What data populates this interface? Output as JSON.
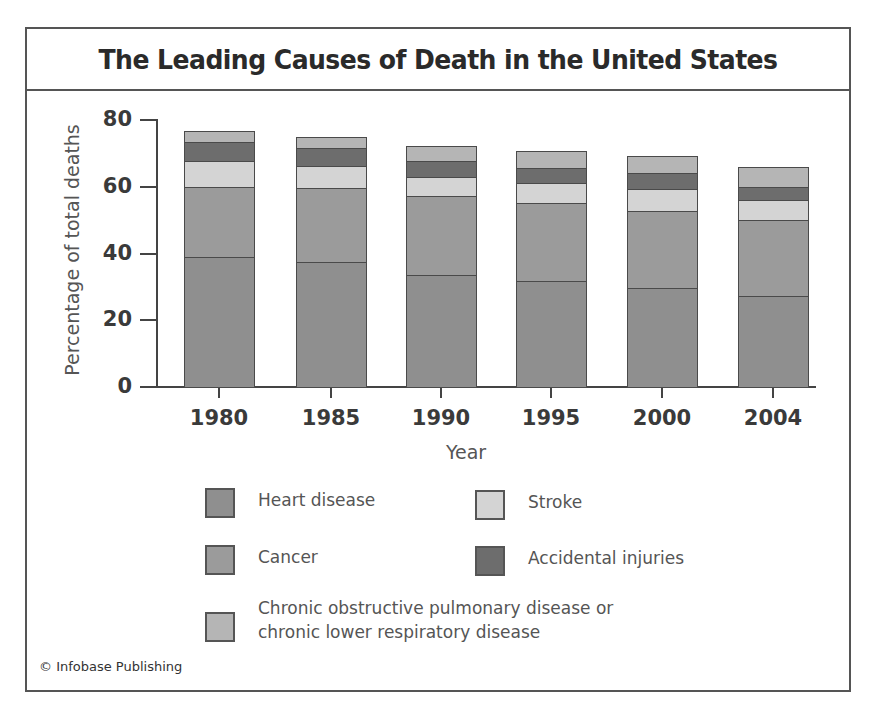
{
  "title": "The Leading Causes of Death in the United States",
  "credit": "© Infobase Publishing",
  "chart_data": {
    "type": "bar",
    "stacked": true,
    "title": "The Leading Causes of Death in the United States",
    "xlabel": "Year",
    "ylabel": "Percentage of total deaths",
    "ylim": [
      0,
      80
    ],
    "yticks": [
      0,
      20,
      40,
      60,
      80
    ],
    "grid": false,
    "legend_position": "bottom",
    "categories": [
      "1980",
      "1985",
      "1990",
      "1995",
      "2000",
      "2004"
    ],
    "series": [
      {
        "name": "Heart disease",
        "color": "#8f8f8f",
        "values": [
          39.0,
          37.4,
          33.5,
          31.7,
          29.7,
          27.3
        ]
      },
      {
        "name": "Cancer",
        "color": "#9b9b9b",
        "values": [
          21.0,
          22.1,
          23.7,
          23.4,
          23.0,
          22.6
        ]
      },
      {
        "name": "Stroke",
        "color": "#d4d4d4",
        "values": [
          7.7,
          6.8,
          5.8,
          6.0,
          6.7,
          6.2
        ]
      },
      {
        "name": "Accidental injuries",
        "color": "#6d6d6d",
        "values": [
          5.6,
          5.3,
          4.7,
          4.6,
          4.6,
          3.7
        ]
      },
      {
        "name": "Chronic obstructive pulmonary disease or chronic lower respiratory disease",
        "color": "#b5b5b5",
        "values": [
          3.3,
          3.3,
          4.5,
          4.9,
          5.2,
          6.1
        ]
      }
    ],
    "totals": [
      76.6,
      74.9,
      72.2,
      70.6,
      69.2,
      65.9
    ]
  },
  "legend": {
    "heart_disease": "Heart disease",
    "cancer": "Cancer",
    "stroke": "Stroke",
    "accidental": "Accidental injuries",
    "copd_line1": "Chronic obstructive pulmonary disease or",
    "copd_line2": "chronic lower respiratory disease"
  }
}
